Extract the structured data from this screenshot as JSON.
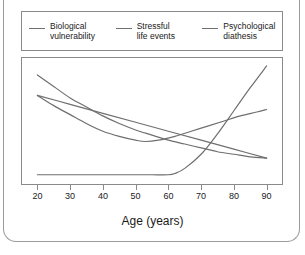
{
  "chart_data": {
    "type": "line",
    "title": "",
    "xlabel": "Age (years)",
    "ylabel": "",
    "xlim": [
      15,
      95
    ],
    "ylim": [
      0,
      100
    ],
    "grid": false,
    "legend_position": "top",
    "xticks": [
      20,
      30,
      40,
      50,
      60,
      70,
      80,
      90
    ],
    "xticklabels": [
      "20",
      "30",
      "40",
      "50",
      "60",
      "70",
      "80",
      "90"
    ],
    "yticks": [],
    "yticklabels": [],
    "line_color": "#6f6f6f",
    "series": [
      {
        "name": "Biological vulnerability",
        "legend_label_line1": "Biological",
        "legend_label_line2": "vulnerability",
        "x": [
          20,
          25,
          30,
          35,
          40,
          45,
          50,
          55,
          60,
          65,
          70,
          75,
          80,
          85,
          90
        ],
        "values": [
          86,
          77,
          68,
          61,
          54,
          48,
          43,
          39,
          35,
          32,
          29,
          26,
          24,
          22,
          21
        ]
      },
      {
        "name": "Stressful life events",
        "legend_label_line1": "Stressful",
        "legend_label_line2": "life events",
        "x": [
          20,
          30,
          40,
          50,
          60,
          70,
          80,
          90
        ],
        "values": [
          70,
          63,
          56,
          49,
          42,
          35,
          28,
          21
        ]
      },
      {
        "name": "Psychological diathesis",
        "legend_label_line1": "Psychological",
        "legend_label_line2": "diathesis",
        "x": [
          20,
          30,
          40,
          50,
          55,
          60,
          62,
          65,
          70,
          75,
          80,
          85,
          90
        ],
        "values": [
          8,
          8,
          8,
          8,
          8,
          8,
          9,
          13,
          24,
          40,
          58,
          76,
          93
        ]
      },
      {
        "name": "Combined risk curve",
        "legend_label_line1": "",
        "legend_label_line2": "",
        "x": [
          20,
          25,
          30,
          35,
          40,
          45,
          50,
          53,
          57,
          62,
          67,
          72,
          77,
          82,
          87,
          90
        ],
        "values": [
          70,
          62,
          55,
          48,
          42,
          38,
          35,
          34,
          35,
          38,
          42,
          46,
          50,
          54,
          57,
          59
        ]
      }
    ]
  },
  "axis": {
    "xlabel": "Age (years)"
  }
}
